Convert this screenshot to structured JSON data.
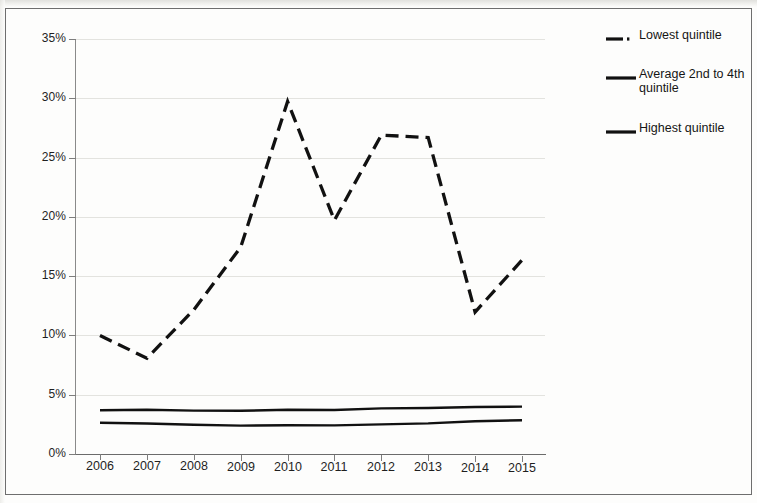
{
  "chart_data": {
    "type": "line",
    "title": "",
    "subtitle": "",
    "xlabel": "",
    "ylabel": "",
    "categories": [
      "2006",
      "2007",
      "2008",
      "2009",
      "2010",
      "2011",
      "2012",
      "2013",
      "2014",
      "2015"
    ],
    "x_tick_labels": [
      "2006",
      "2007",
      "2008",
      "2009",
      "2010",
      "2011",
      "2012",
      "2013",
      "2014",
      "2015"
    ],
    "y_tick_labels": [
      "0%",
      "5%",
      "10%",
      "15%",
      "20%",
      "25%",
      "30%",
      "35%"
    ],
    "y_tick_values": [
      0,
      5,
      10,
      15,
      20,
      25,
      30,
      35
    ],
    "ylim": [
      0,
      35
    ],
    "y_unit": "%",
    "grid": "horizontal",
    "legend_position": "right",
    "series": [
      {
        "name": "Lowest quintile",
        "style": "dashed",
        "color": "#111111",
        "values": [
          10.0,
          8.1,
          12.2,
          17.5,
          29.8,
          19.8,
          27.0,
          26.8,
          12.1,
          16.5
        ]
      },
      {
        "name": "Average 2nd to 4th quintile",
        "style": "solid",
        "color": "#111111",
        "values": [
          3.7,
          3.75,
          3.7,
          3.7,
          3.8,
          3.8,
          3.95,
          4.0,
          4.1,
          4.15
        ]
      },
      {
        "name": "Highest quintile",
        "style": "solid",
        "color": "#111111",
        "values": [
          2.65,
          2.6,
          2.5,
          2.45,
          2.5,
          2.5,
          2.6,
          2.7,
          2.9,
          3.0
        ]
      }
    ]
  },
  "legend": {
    "items": [
      {
        "label": "Lowest quintile",
        "style": "dashed"
      },
      {
        "label": "Average 2nd to 4th quintile",
        "style": "solid"
      },
      {
        "label": "Highest quintile",
        "style": "solid"
      }
    ]
  },
  "axes": {
    "y_labels": [
      "35%",
      "30%",
      "25%",
      "20%",
      "15%",
      "10%",
      "5%",
      "0%"
    ],
    "x_labels": [
      "2006",
      "2007",
      "2008",
      "2009",
      "2010",
      "2011",
      "2012",
      "2013",
      "2014",
      "2015"
    ]
  }
}
